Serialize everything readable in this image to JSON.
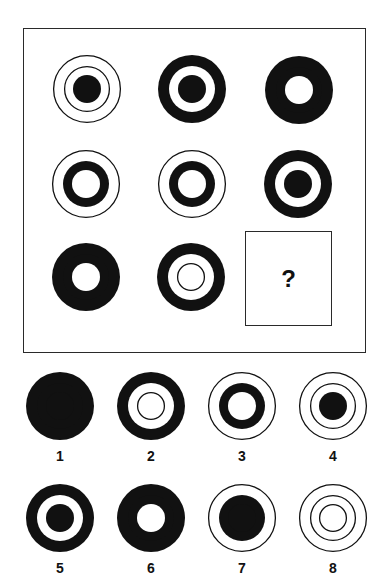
{
  "puzzle": {
    "type": "matrix-reasoning",
    "grid_size": "3x3",
    "colors": {
      "ink": "#111111",
      "paper": "#ffffff",
      "frame": "#2a2a2a"
    },
    "zone_radii": {
      "outer": 34,
      "middle": 23,
      "inner": 14
    },
    "legend": "Each figure has three concentric zones (outer, middle, inner). 'fill' = solid black disc at that radius, 'ring' = thin outline circle, 'hole' = white disc, 'none' = absent.",
    "question_mark": "?",
    "cells": [
      {
        "row": 1,
        "col": 1,
        "cx": 87,
        "cy": 89,
        "outer": "ring",
        "middle": "ring",
        "inner": "fill",
        "description": "Two thin rings with solid black center"
      },
      {
        "row": 1,
        "col": 2,
        "cx": 192,
        "cy": 89,
        "outer": "fill",
        "middle": "hole",
        "inner": "fill",
        "description": "Black outer band, white ring, black center"
      },
      {
        "row": 1,
        "col": 3,
        "cx": 299,
        "cy": 90,
        "outer": "fill",
        "middle": "fill",
        "inner": "hole",
        "description": "Thick black donut with small white hole"
      },
      {
        "row": 2,
        "col": 1,
        "cx": 86,
        "cy": 184,
        "outer": "ring",
        "middle": "fill",
        "inner": "hole",
        "description": "Thin outer ring, black band, white center"
      },
      {
        "row": 2,
        "col": 2,
        "cx": 192,
        "cy": 184,
        "outer": "ring",
        "middle": "fill",
        "inner": "hole",
        "description": "Thin outer ring, black band, white center"
      },
      {
        "row": 2,
        "col": 3,
        "cx": 298,
        "cy": 184,
        "outer": "fill",
        "middle": "hole",
        "inner": "fill",
        "description": "Black outer band, white ring, black center"
      },
      {
        "row": 3,
        "col": 1,
        "cx": 86,
        "cy": 277,
        "outer": "fill",
        "middle": "fill",
        "inner": "hole",
        "description": "Thick black donut with small white hole"
      },
      {
        "row": 3,
        "col": 2,
        "cx": 191,
        "cy": 277,
        "outer": "fill",
        "middle": "hole",
        "inner": "ring",
        "description": "Black outer band, white interior with thin inner ring"
      },
      {
        "row": 3,
        "col": 3,
        "missing": true,
        "label": "?"
      }
    ]
  },
  "options": [
    {
      "label": "1",
      "cx": 60,
      "cy": 406,
      "outer": "fill",
      "middle": "fill",
      "inner": "fill",
      "description": "Solid black disc"
    },
    {
      "label": "2",
      "cx": 151,
      "cy": 406,
      "outer": "fill",
      "middle": "hole",
      "inner": "ring",
      "description": "Black outer band, white interior with thin inner ring"
    },
    {
      "label": "3",
      "cx": 242,
      "cy": 406,
      "outer": "ring",
      "middle": "fill",
      "inner": "hole",
      "description": "Thin outer ring, black band, white center"
    },
    {
      "label": "4",
      "cx": 333,
      "cy": 406,
      "outer": "ring",
      "middle": "ring",
      "inner": "fill",
      "description": "Two thin rings with solid black center"
    },
    {
      "label": "5",
      "cx": 60,
      "cy": 518,
      "outer": "fill",
      "middle": "hole",
      "inner": "fill",
      "description": "Black outer band, white ring, black center"
    },
    {
      "label": "6",
      "cx": 151,
      "cy": 518,
      "outer": "fill",
      "middle": "fill",
      "inner": "hole",
      "description": "Thick black donut with small white hole"
    },
    {
      "label": "7",
      "cx": 242,
      "cy": 518,
      "outer": "ring",
      "middle": "fill",
      "inner": "fill",
      "description": "Thin outer ring around large solid black disc"
    },
    {
      "label": "8",
      "cx": 333,
      "cy": 518,
      "outer": "ring",
      "middle": "ring",
      "inner": "ring",
      "description": "Three thin concentric rings"
    }
  ],
  "option_label_offset_y": 37
}
